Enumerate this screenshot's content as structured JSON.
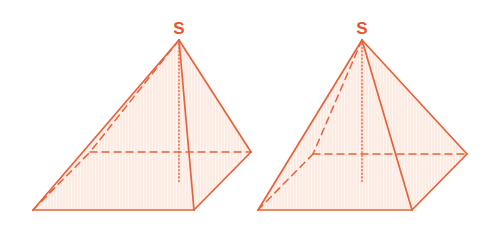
{
  "diagram": {
    "type": "geometry",
    "colors": {
      "stroke": "#E8613A",
      "fill": "#FDEEE6",
      "label": "#E8532E"
    },
    "pyramids": [
      {
        "id": "pyramid-left",
        "apex_label": "S",
        "apex": [
          179,
          40
        ],
        "base": {
          "A": [
            33,
            210
          ],
          "B": [
            194,
            210
          ],
          "C": [
            251,
            152
          ],
          "D": [
            90,
            152
          ]
        },
        "height_foot": [
          179,
          182
        ],
        "hidden_edges": [
          "S-D",
          "A-D",
          "D-C"
        ],
        "visible_edges": [
          "S-A",
          "S-B",
          "S-C",
          "A-B",
          "B-C"
        ]
      },
      {
        "id": "pyramid-right",
        "apex_label": "S",
        "apex": [
          362,
          40
        ],
        "base": {
          "A": [
            258,
            210
          ],
          "B": [
            412,
            210
          ],
          "C": [
            467,
            154
          ],
          "D": [
            313,
            154
          ]
        },
        "height_foot": [
          362,
          182
        ],
        "hidden_edges": [
          "S-D",
          "A-D",
          "D-C"
        ],
        "visible_edges": [
          "S-A",
          "S-B",
          "S-C",
          "A-B",
          "B-C"
        ]
      }
    ]
  }
}
